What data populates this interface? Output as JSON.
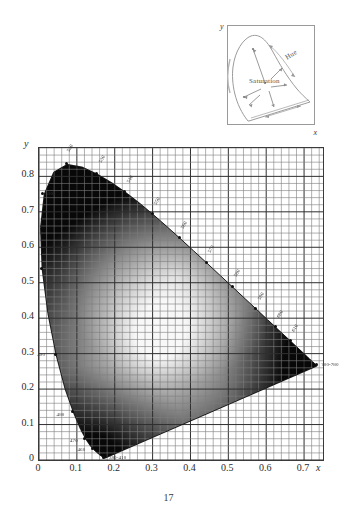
{
  "figure": {
    "number": "17",
    "caption": ""
  },
  "inset": {
    "axis_x_label": "x",
    "axis_y_label": "y",
    "hue_label": "Hue",
    "saturation_label": "Saturation"
  },
  "chart_data": {
    "type": "scatter",
    "title": "",
    "xlabel": "x",
    "ylabel": "y",
    "xlim": [
      0,
      0.75
    ],
    "ylim": [
      0,
      0.88
    ],
    "grid": true,
    "minor_grid": true,
    "legend": "none",
    "xticks": [
      0,
      0.1,
      0.2,
      0.3,
      0.4,
      0.5,
      0.6,
      0.7
    ],
    "xtick_labels": [
      "0",
      "0.1",
      "0.2",
      "0.3",
      "0.4",
      "0.5",
      "0.6",
      "0.7"
    ],
    "yticks": [
      0,
      0.1,
      0.2,
      0.3,
      0.4,
      0.5,
      0.6,
      0.7,
      0.8
    ],
    "ytick_labels": [
      "0",
      "0.1",
      "0.2",
      "0.3",
      "0.4",
      "0.5",
      "0.6",
      "0.7",
      "0.8"
    ],
    "annotations": [
      {
        "label": "520",
        "x": 0.0743,
        "y": 0.8338
      },
      {
        "label": "530",
        "x": 0.1547,
        "y": 0.8059
      },
      {
        "label": "540",
        "x": 0.2296,
        "y": 0.7543
      },
      {
        "label": "550",
        "x": 0.3016,
        "y": 0.6923
      },
      {
        "label": "560",
        "x": 0.3731,
        "y": 0.6245
      },
      {
        "label": "570",
        "x": 0.4441,
        "y": 0.5547
      },
      {
        "label": "580",
        "x": 0.5125,
        "y": 0.4866
      },
      {
        "label": "590",
        "x": 0.5752,
        "y": 0.4242
      },
      {
        "label": "600",
        "x": 0.627,
        "y": 0.3725
      },
      {
        "label": "610",
        "x": 0.6658,
        "y": 0.334
      },
      {
        "label": "700-780",
        "x": 0.7347,
        "y": 0.2653
      },
      {
        "label": "510",
        "x": 0.0113,
        "y": 0.75
      },
      {
        "label": "500",
        "x": 0.0082,
        "y": 0.5384
      },
      {
        "label": "490",
        "x": 0.0454,
        "y": 0.295
      },
      {
        "label": "480",
        "x": 0.0913,
        "y": 0.1327
      },
      {
        "label": "470",
        "x": 0.1241,
        "y": 0.0578
      },
      {
        "label": "460",
        "x": 0.144,
        "y": 0.0297
      },
      {
        "label": "380-410",
        "x": 0.1741,
        "y": 0.005
      }
    ],
    "spectral_locus": [
      [
        0.1741,
        0.005
      ],
      [
        0.174,
        0.005
      ],
      [
        0.1738,
        0.0049
      ],
      [
        0.1736,
        0.0049
      ],
      [
        0.1733,
        0.0048
      ],
      [
        0.173,
        0.0048
      ],
      [
        0.1726,
        0.0048
      ],
      [
        0.1721,
        0.0048
      ],
      [
        0.1714,
        0.0051
      ],
      [
        0.1703,
        0.0058
      ],
      [
        0.1689,
        0.0069
      ],
      [
        0.1669,
        0.0086
      ],
      [
        0.1644,
        0.0109
      ],
      [
        0.1611,
        0.0138
      ],
      [
        0.1566,
        0.0177
      ],
      [
        0.151,
        0.0227
      ],
      [
        0.144,
        0.0297
      ],
      [
        0.1355,
        0.0399
      ],
      [
        0.1241,
        0.0578
      ],
      [
        0.1096,
        0.0868
      ],
      [
        0.0913,
        0.1327
      ],
      [
        0.0687,
        0.2007
      ],
      [
        0.0454,
        0.295
      ],
      [
        0.0235,
        0.4127
      ],
      [
        0.0082,
        0.5384
      ],
      [
        0.0039,
        0.6548
      ],
      [
        0.0139,
        0.7502
      ],
      [
        0.0389,
        0.812
      ],
      [
        0.0743,
        0.8338
      ],
      [
        0.1142,
        0.8262
      ],
      [
        0.1547,
        0.8059
      ],
      [
        0.1929,
        0.7816
      ],
      [
        0.2296,
        0.7543
      ],
      [
        0.2658,
        0.7243
      ],
      [
        0.3016,
        0.6923
      ],
      [
        0.3373,
        0.6589
      ],
      [
        0.3731,
        0.6245
      ],
      [
        0.4087,
        0.5896
      ],
      [
        0.4441,
        0.5547
      ],
      [
        0.4788,
        0.5202
      ],
      [
        0.5125,
        0.4866
      ],
      [
        0.5448,
        0.4544
      ],
      [
        0.5752,
        0.4242
      ],
      [
        0.6029,
        0.3965
      ],
      [
        0.627,
        0.3725
      ],
      [
        0.6482,
        0.3514
      ],
      [
        0.6658,
        0.334
      ],
      [
        0.6801,
        0.3197
      ],
      [
        0.6915,
        0.3083
      ],
      [
        0.7006,
        0.2993
      ],
      [
        0.7079,
        0.292
      ],
      [
        0.714,
        0.2859
      ],
      [
        0.719,
        0.2809
      ],
      [
        0.723,
        0.277
      ],
      [
        0.726,
        0.274
      ],
      [
        0.7283,
        0.2717
      ],
      [
        0.73,
        0.27
      ],
      [
        0.7311,
        0.2689
      ],
      [
        0.732,
        0.268
      ],
      [
        0.7327,
        0.2673
      ],
      [
        0.7334,
        0.2666
      ],
      [
        0.734,
        0.266
      ],
      [
        0.7344,
        0.2656
      ],
      [
        0.7346,
        0.2654
      ],
      [
        0.7347,
        0.2653
      ]
    ]
  }
}
